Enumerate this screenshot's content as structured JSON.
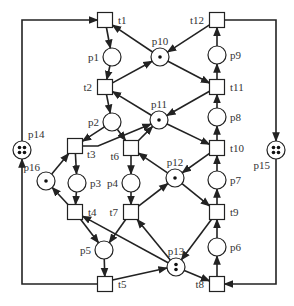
{
  "diagram": {
    "type": "petri-net",
    "places": [
      {
        "id": "p1",
        "label": "p1",
        "x": 112,
        "y": 57,
        "tokens": 0,
        "label_pos": "left"
      },
      {
        "id": "p2",
        "label": "p2",
        "x": 112,
        "y": 122,
        "tokens": 0,
        "label_pos": "left"
      },
      {
        "id": "p3",
        "label": "p3",
        "x": 77,
        "y": 183,
        "tokens": 0,
        "label_pos": "right"
      },
      {
        "id": "p4",
        "label": "p4",
        "x": 131,
        "y": 183,
        "tokens": 0,
        "label_pos": "left"
      },
      {
        "id": "p5",
        "label": "p5",
        "x": 104,
        "y": 250,
        "tokens": 0,
        "label_pos": "left"
      },
      {
        "id": "p6",
        "label": "p6",
        "x": 217,
        "y": 247,
        "tokens": 0,
        "label_pos": "right"
      },
      {
        "id": "p7",
        "label": "p7",
        "x": 217,
        "y": 180,
        "tokens": 0,
        "label_pos": "right"
      },
      {
        "id": "p8",
        "label": "p8",
        "x": 217,
        "y": 117,
        "tokens": 0,
        "label_pos": "right"
      },
      {
        "id": "p9",
        "label": "p9",
        "x": 217,
        "y": 55,
        "tokens": 0,
        "label_pos": "right"
      },
      {
        "id": "p10",
        "label": "p10",
        "x": 160,
        "y": 57,
        "tokens": 1,
        "label_pos": "top"
      },
      {
        "id": "p11",
        "label": "p11",
        "x": 159,
        "y": 120,
        "tokens": 1,
        "label_pos": "top"
      },
      {
        "id": "p12",
        "label": "p12",
        "x": 175,
        "y": 178,
        "tokens": 1,
        "label_pos": "top"
      },
      {
        "id": "p13",
        "label": "p13",
        "x": 176,
        "y": 267,
        "tokens": 2,
        "label_pos": "top"
      },
      {
        "id": "p14",
        "label": "p14",
        "x": 22,
        "y": 150,
        "tokens": 4,
        "label_pos": "top-right"
      },
      {
        "id": "p15",
        "label": "p15",
        "x": 276,
        "y": 150,
        "tokens": 4,
        "label_pos": "bottom-left"
      },
      {
        "id": "p16",
        "label": "p16",
        "x": 46,
        "y": 181,
        "tokens": 1,
        "label_pos": "top-left"
      }
    ],
    "transitions": [
      {
        "id": "t1",
        "label": "t1",
        "x": 105,
        "y": 20,
        "label_pos": "right"
      },
      {
        "id": "t2",
        "label": "t2",
        "x": 105,
        "y": 87,
        "label_pos": "left"
      },
      {
        "id": "t3",
        "label": "t3",
        "x": 75,
        "y": 146,
        "label_pos": "below-right"
      },
      {
        "id": "t4",
        "label": "t4",
        "x": 75,
        "y": 212,
        "label_pos": "right"
      },
      {
        "id": "t5",
        "label": "t5",
        "x": 105,
        "y": 284,
        "label_pos": "right"
      },
      {
        "id": "t6",
        "label": "t6",
        "x": 131,
        "y": 148,
        "label_pos": "below-left"
      },
      {
        "id": "t7",
        "label": "t7",
        "x": 131,
        "y": 212,
        "label_pos": "left"
      },
      {
        "id": "t8",
        "label": "t8",
        "x": 217,
        "y": 284,
        "label_pos": "left"
      },
      {
        "id": "t9",
        "label": "t9",
        "x": 217,
        "y": 212,
        "label_pos": "right"
      },
      {
        "id": "t10",
        "label": "t10",
        "x": 217,
        "y": 148,
        "label_pos": "right"
      },
      {
        "id": "t11",
        "label": "t11",
        "x": 217,
        "y": 87,
        "label_pos": "right"
      },
      {
        "id": "t12",
        "label": "t12",
        "x": 217,
        "y": 20,
        "label_pos": "left"
      }
    ],
    "arcs": [
      [
        "t1",
        "p1"
      ],
      [
        "p1",
        "t2"
      ],
      [
        "t2",
        "p2"
      ],
      [
        "p2",
        "t3"
      ],
      [
        "p2",
        "t6"
      ],
      [
        "t3",
        "p3"
      ],
      [
        "p3",
        "t4"
      ],
      [
        "t6",
        "p4"
      ],
      [
        "p4",
        "t7"
      ],
      [
        "t4",
        "p5"
      ],
      [
        "t7",
        "p5"
      ],
      [
        "p5",
        "t5"
      ],
      [
        "t8",
        "p6"
      ],
      [
        "p6",
        "t9"
      ],
      [
        "t9",
        "p7"
      ],
      [
        "p7",
        "t10"
      ],
      [
        "t10",
        "p8"
      ],
      [
        "p8",
        "t11"
      ],
      [
        "t11",
        "p9"
      ],
      [
        "p9",
        "t12"
      ],
      [
        "t12",
        "p10"
      ],
      [
        "p10",
        "t1"
      ],
      [
        "t2",
        "p10"
      ],
      [
        "p10",
        "t11"
      ],
      [
        "t11",
        "p11"
      ],
      [
        "p11",
        "t2"
      ],
      [
        "t3",
        "p11"
      ],
      [
        "t6",
        "p11"
      ],
      [
        "p11",
        "t10"
      ],
      [
        "t10",
        "p12"
      ],
      [
        "p12",
        "t6"
      ],
      [
        "t7",
        "p12"
      ],
      [
        "p12",
        "t9"
      ],
      [
        "t9",
        "p13"
      ],
      [
        "p13",
        "t7"
      ],
      [
        "p13",
        "t4"
      ],
      [
        "t5",
        "p13"
      ],
      [
        "p13",
        "t8"
      ],
      [
        "t5",
        "p14"
      ],
      [
        "p14",
        "t1"
      ],
      [
        "t12",
        "p15"
      ],
      [
        "p15",
        "t8"
      ],
      [
        "t4",
        "p16"
      ],
      [
        "p16",
        "t3"
      ]
    ],
    "footer_fragment": "..."
  }
}
